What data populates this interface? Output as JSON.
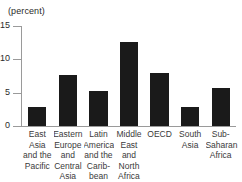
{
  "chart_data": {
    "type": "bar",
    "title": "",
    "subtitle": "",
    "unit_label": "(percent)",
    "xlabel": "",
    "ylabel": "",
    "ylim": [
      0,
      15
    ],
    "yticks": [
      0,
      5,
      10,
      15
    ],
    "ytick_labels": [
      "0",
      "5",
      "10",
      "15"
    ],
    "grid": false,
    "legend": false,
    "bar_color": "#1a1a1a",
    "axis_color": "#9a9a9a",
    "categories": [
      "East Asia and the Pacific",
      "Eastern Europe and Central Asia",
      "Latin America and the Caribbean",
      "Middle East and North Africa",
      "OECD",
      "South Asia",
      "Sub-Saharan Africa"
    ],
    "category_lines": [
      "East Asia\nand the\nPacific",
      "Eastern\nEurope\nand\nCentral\nAsia",
      "Latin\nAmerica\nand the\nCarib-\nbean",
      "Middle\nEast\nand\nNorth\nAfrica",
      "OECD",
      "South\nAsia",
      "Sub-\nSaharan\nAfrica"
    ],
    "values": [
      2.9,
      7.7,
      5.3,
      12.6,
      8.0,
      2.9,
      5.7
    ]
  }
}
